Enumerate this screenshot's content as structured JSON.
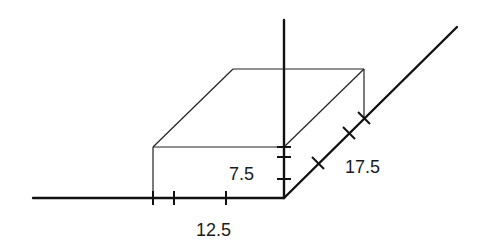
{
  "diagram": {
    "colors": {
      "stroke": "#111111",
      "background": "#ffffff"
    },
    "labels": {
      "width": "12.5",
      "height": "7.5",
      "depth": "17.5"
    }
  }
}
